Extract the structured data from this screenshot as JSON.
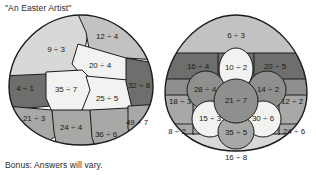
{
  "worksheet": {
    "title": "\"An Easter Artist\"",
    "bonus": "Bonus: Answers will vary."
  },
  "palette": {
    "very_light": "#f2f2f0",
    "light": "#d8d8d6",
    "medium_light": "#c2c2c0",
    "medium": "#a8a8a6",
    "medium_dark": "#8f8f8d",
    "dark": "#6e6e6c",
    "outline": "#1b1b1b",
    "text": "#1a1a1a",
    "background": "#ffffff"
  },
  "eggs": [
    {
      "name": "left-egg",
      "layout": "patchwork",
      "cells": [
        {
          "id": "l1",
          "label": "9 ÷ 3",
          "shade": "light",
          "x": 50,
          "y": 36
        },
        {
          "id": "l2",
          "label": "12 ÷ 4",
          "shade": "medium_light",
          "x": 101,
          "y": 23
        },
        {
          "id": "l3",
          "label": "20 ÷ 4",
          "shade": "very_light",
          "x": 94,
          "y": 52
        },
        {
          "id": "l4",
          "label": "4 ÷ 1",
          "shade": "dark",
          "x": 19,
          "y": 74
        },
        {
          "id": "l5",
          "label": "35 ÷ 7",
          "shade": "very_light",
          "x": 59,
          "y": 75
        },
        {
          "id": "l6",
          "label": "25 ÷ 5",
          "shade": "very_light",
          "x": 100,
          "y": 84
        },
        {
          "id": "l7",
          "label": "32 ÷ 8",
          "shade": "dark",
          "x": 131,
          "y": 72
        },
        {
          "id": "l8",
          "label": "21 ÷ 3",
          "shade": "medium",
          "x": 30,
          "y": 104
        },
        {
          "id": "l9",
          "label": "24 ÷ 4",
          "shade": "medium",
          "x": 66,
          "y": 113
        },
        {
          "id": "l10",
          "label": "36 ÷ 6",
          "shade": "medium",
          "x": 99,
          "y": 120
        },
        {
          "id": "l11",
          "label": "49 ÷ 7",
          "shade": "medium",
          "x": 130,
          "y": 108
        }
      ]
    },
    {
      "name": "right-egg",
      "layout": "flower",
      "cells": [
        {
          "id": "r1",
          "label": "6 ÷ 3",
          "shade": "medium_light",
          "x": 76,
          "y": 21
        },
        {
          "id": "r2",
          "label": "16 ÷ 4",
          "shade": "dark",
          "x": 40,
          "y": 54
        },
        {
          "id": "r3",
          "label": "20 ÷ 5",
          "shade": "dark",
          "x": 112,
          "y": 54
        },
        {
          "id": "r4",
          "label": "10 ÷ 2",
          "shade": "very_light",
          "x": 76,
          "y": 55
        },
        {
          "id": "r5",
          "label": "28 ÷ 4",
          "shade": "medium_light",
          "x": 43,
          "y": 75
        },
        {
          "id": "r6",
          "label": "14 ÷ 2",
          "shade": "medium_light",
          "x": 110,
          "y": 75
        },
        {
          "id": "r7",
          "label": "18 ÷ 3",
          "shade": "medium",
          "x": 22,
          "y": 88
        },
        {
          "id": "r8",
          "label": "12 ÷ 2",
          "shade": "medium",
          "x": 130,
          "y": 88
        },
        {
          "id": "r9",
          "label": "21 ÷ 7",
          "shade": "medium_light",
          "x": 76,
          "y": 87
        },
        {
          "id": "r10",
          "label": "15 ÷ 3",
          "shade": "very_light",
          "x": 48,
          "y": 105
        },
        {
          "id": "r11",
          "label": "30 ÷ 6",
          "shade": "very_light",
          "x": 104,
          "y": 105
        },
        {
          "id": "r12",
          "label": "8 ÷ 2",
          "shade": "medium",
          "x": 20,
          "y": 118
        },
        {
          "id": "r13",
          "label": "24 ÷ 6",
          "shade": "medium",
          "x": 131,
          "y": 118
        },
        {
          "id": "r14",
          "label": "35 ÷ 5",
          "shade": "medium_light",
          "x": 76,
          "y": 119
        },
        {
          "id": "r15",
          "label": "16 ÷ 8",
          "shade": "light",
          "x": 76,
          "y": 143
        }
      ]
    }
  ]
}
